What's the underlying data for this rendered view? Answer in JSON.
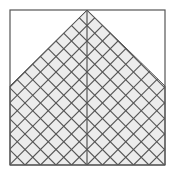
{
  "diagram": {
    "type": "hatched-pentagon-in-square",
    "canvas": {
      "width": 174,
      "height": 176,
      "background": "#ffffff"
    },
    "frame": {
      "x": 10,
      "y": 10,
      "width": 155,
      "height": 155,
      "stroke": "#555555"
    },
    "shape": {
      "points": "87,10 165,86 165,165 10,165 10,86",
      "fill": "#ececec",
      "hatch_color": "#555555",
      "hatch_spacing": 15.5,
      "hatch_angles": [
        45,
        -45
      ]
    },
    "center_line": {
      "x": 87,
      "y1": 10,
      "y2": 165,
      "stroke": "#555555"
    }
  }
}
